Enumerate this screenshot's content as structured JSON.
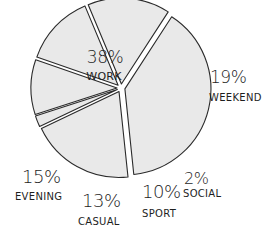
{
  "chart_data": {
    "type": "pie",
    "title": "",
    "style": "hand-drawn exploded pie",
    "colors": {
      "fill": "#e9e9e9",
      "stroke": "#2a2a2a",
      "text": "#1e1e1e",
      "background": "#ffffff"
    },
    "slices": [
      {
        "label": "WORK",
        "value": 38,
        "pct_text": "38%"
      },
      {
        "label": "WEEKEND",
        "value": 19,
        "pct_text": "19%"
      },
      {
        "label": "SOCIAL",
        "value": 2,
        "pct_text": "2%"
      },
      {
        "label": "SPORT",
        "value": 10,
        "pct_text": "10%"
      },
      {
        "label": "CASUAL",
        "value": 13,
        "pct_text": "13%"
      },
      {
        "label": "EVENING",
        "value": 15,
        "pct_text": "15%"
      }
    ],
    "legend": "none (labels placed next to slices)"
  },
  "layout": {
    "center": [
      121,
      88
    ],
    "radius": 86,
    "start_angle_deg": -57,
    "explode": 4,
    "labels": [
      {
        "pct_x": 105,
        "pct_y": 63,
        "lbl_x": 104,
        "lbl_y": 80,
        "anchor": "middle",
        "pct_size": 17,
        "lbl_size": 11
      },
      {
        "pct_x": 210,
        "pct_y": 83,
        "lbl_x": 209,
        "lbl_y": 101,
        "anchor": "start",
        "pct_size": 17,
        "lbl_size": 10
      },
      {
        "pct_x": 184,
        "pct_y": 184,
        "lbl_x": 183,
        "lbl_y": 197,
        "anchor": "start",
        "pct_size": 16,
        "lbl_size": 10
      },
      {
        "pct_x": 142,
        "pct_y": 198,
        "lbl_x": 142,
        "lbl_y": 217,
        "anchor": "start",
        "pct_size": 18,
        "lbl_size": 10
      },
      {
        "pct_x": 82,
        "pct_y": 207,
        "lbl_x": 78,
        "lbl_y": 225,
        "anchor": "start",
        "pct_size": 18,
        "lbl_size": 10
      },
      {
        "pct_x": 22,
        "pct_y": 183,
        "lbl_x": 15,
        "lbl_y": 200,
        "anchor": "start",
        "pct_size": 18,
        "lbl_size": 10
      }
    ]
  }
}
